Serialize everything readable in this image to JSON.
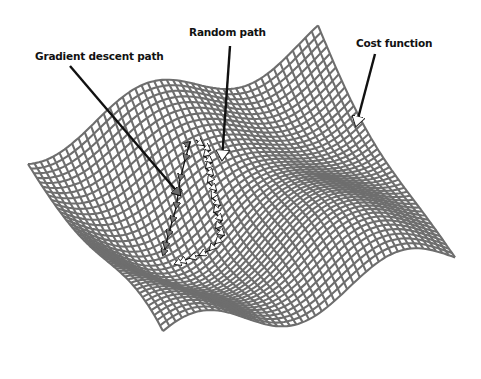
{
  "diagram": {
    "type": "3d-surface-illustration",
    "colors": {
      "background": "#ffffff",
      "mesh": "#6e6e6e",
      "mesh_dark": "#555555",
      "arrow": "#111111",
      "gradient_arrowheads": "#666666",
      "random_arrowheads": "#ffffff"
    },
    "labels": [
      {
        "id": "gradient",
        "text": "Gradient descent path",
        "x": 35,
        "y": 50
      },
      {
        "id": "random",
        "text": "Random path",
        "x": 189,
        "y": 26
      },
      {
        "id": "cost",
        "text": "Cost function",
        "x": 356,
        "y": 37
      }
    ],
    "callout_arrows": [
      {
        "id": "gradient-arrow",
        "from": [
          70,
          66
        ],
        "to": [
          180,
          195
        ],
        "head": "gray"
      },
      {
        "id": "random-arrow",
        "from": [
          230,
          46
        ],
        "to": [
          222,
          160
        ],
        "head": "white"
      },
      {
        "id": "cost-arrow",
        "from": [
          375,
          54
        ],
        "to": [
          356,
          126
        ],
        "head": "white"
      }
    ],
    "gradient_path": [
      [
        185,
        147
      ],
      [
        190,
        142
      ],
      [
        185,
        160
      ],
      [
        180,
        180
      ],
      [
        178,
        195
      ],
      [
        176,
        208
      ],
      [
        172,
        222
      ],
      [
        168,
        236
      ],
      [
        165,
        248
      ],
      [
        163,
        255
      ]
    ],
    "random_path": [
      [
        196,
        140
      ],
      [
        203,
        145
      ],
      [
        210,
        150
      ],
      [
        204,
        156
      ],
      [
        212,
        162
      ],
      [
        206,
        168
      ],
      [
        213,
        175
      ],
      [
        208,
        182
      ],
      [
        216,
        190
      ],
      [
        212,
        198
      ],
      [
        220,
        205
      ],
      [
        214,
        212
      ],
      [
        222,
        220
      ],
      [
        216,
        228
      ],
      [
        224,
        235
      ],
      [
        216,
        243
      ],
      [
        210,
        250
      ],
      [
        200,
        255
      ],
      [
        190,
        258
      ],
      [
        180,
        262
      ],
      [
        175,
        264
      ]
    ]
  }
}
